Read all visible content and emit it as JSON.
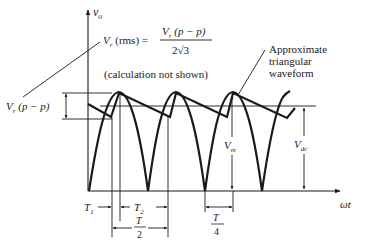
{
  "figure": {
    "type": "waveform-diagram",
    "y_axis_label": "v",
    "y_axis_label_sub": "o",
    "x_axis_label": "ωt",
    "formula": {
      "lhs_v": "V",
      "lhs_sub": "r",
      "lhs_rest": " (rms) =",
      "numerator_v": "V",
      "numerator_sub": "r",
      "numerator_rest": " (p − p)",
      "denominator": "2√3"
    },
    "note": "(calculation not shown)",
    "annotation_triangular": [
      "Approximate",
      "triangular",
      "waveform"
    ],
    "ripple_label_v": "V",
    "ripple_label_sub": "r",
    "ripple_label_rest": " (p − p)",
    "vm_label_v": "V",
    "vm_label_sub": "m",
    "vdc_label_v": "V",
    "vdc_label_sub": "dc",
    "t1_label_v": "T",
    "t1_label_sub": "1",
    "t2_label_v": "T",
    "t2_label_sub": "2",
    "half_period_num": "T",
    "half_period_den": "2",
    "quarter_period_num": "T",
    "quarter_period_den": "4"
  },
  "colors": {
    "ink": "#1a1a1a",
    "background": "#ffffff"
  }
}
